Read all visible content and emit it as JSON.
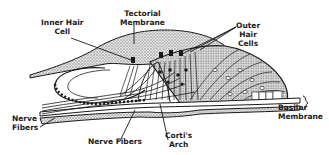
{
  "diagram": {
    "colors": {
      "ink": "#1a1a1a",
      "stipple": "#b8b8b8",
      "background": "#ffffff"
    },
    "labels": {
      "inner_hair_cell": {
        "line1": "Inner Hair",
        "line2": "Cell"
      },
      "tectorial_membrane": {
        "line1": "Tectorial",
        "line2": "Membrane"
      },
      "outer_hair_cells": {
        "line1": "Outer",
        "line2": "Hair",
        "line3": "Cells"
      },
      "nerve_fibers_left": {
        "line1": "Nerve",
        "line2": "Fibers"
      },
      "nerve_fibers_bottom": {
        "line1": "Nerve Fibers"
      },
      "cortis_arch": {
        "line1": "Corti's",
        "line2": "Arch"
      },
      "basilar_membrane": {
        "line1": "Basilar",
        "line2": "Membrane"
      }
    }
  }
}
